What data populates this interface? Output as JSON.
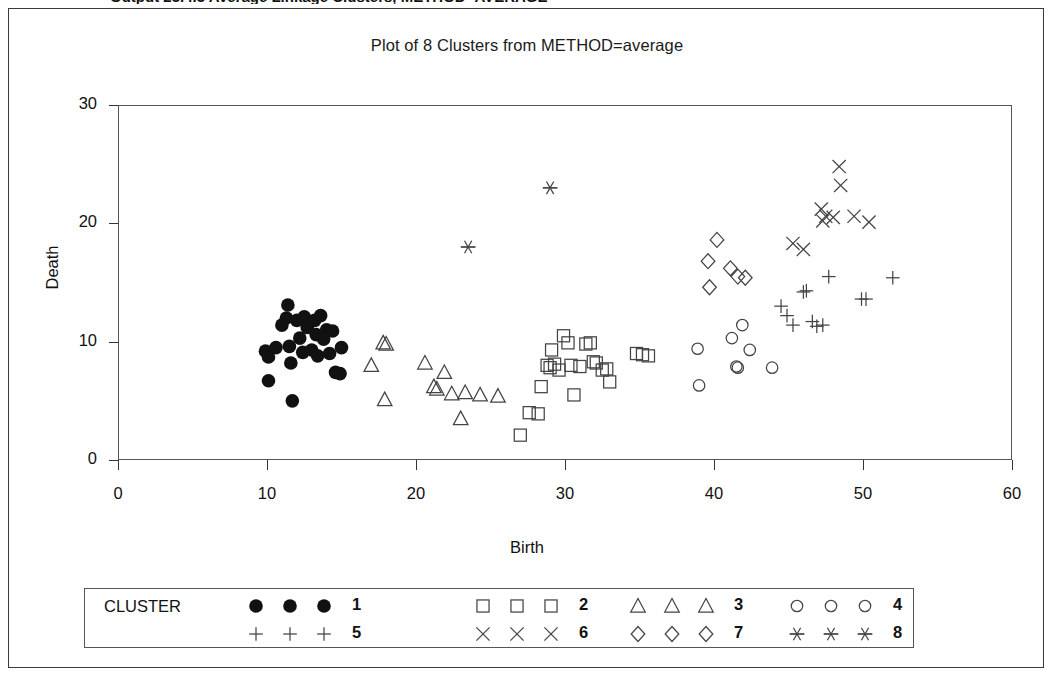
{
  "top_heading": "Output 23.4.3 Average Linkage Clusters, METHOD=AVERAGE",
  "chart_title": "Plot of 8 Clusters from METHOD=average",
  "axes": {
    "xlabel": "Birth",
    "ylabel": "Death",
    "xticks": [
      "0",
      "10",
      "20",
      "30",
      "40",
      "50",
      "60"
    ],
    "yticks": [
      "0",
      "10",
      "20",
      "30"
    ]
  },
  "legend": {
    "title": "CLUSTER",
    "entries": [
      {
        "label": "1",
        "symbol": "filled-circle"
      },
      {
        "label": "2",
        "symbol": "square"
      },
      {
        "label": "3",
        "symbol": "triangle"
      },
      {
        "label": "4",
        "symbol": "circle"
      },
      {
        "label": "5",
        "symbol": "plus"
      },
      {
        "label": "6",
        "symbol": "cross"
      },
      {
        "label": "7",
        "symbol": "diamond"
      },
      {
        "label": "8",
        "symbol": "asterisk"
      }
    ]
  },
  "chart_data": {
    "type": "scatter",
    "title": "Plot of 8 Clusters from METHOD=average",
    "xlabel": "Birth",
    "ylabel": "Death",
    "xlim": [
      0,
      60
    ],
    "ylim": [
      0,
      30
    ],
    "xticks": [
      0,
      10,
      20,
      30,
      40,
      50,
      60
    ],
    "yticks": [
      0,
      10,
      20,
      30
    ],
    "grid": false,
    "legend_position": "bottom",
    "series": [
      {
        "name": "1",
        "symbol": "filled-circle",
        "points": [
          [
            9.9,
            9.2
          ],
          [
            10.1,
            8.7
          ],
          [
            10.1,
            6.7
          ],
          [
            10.6,
            9.5
          ],
          [
            11.0,
            11.4
          ],
          [
            11.3,
            12.0
          ],
          [
            11.4,
            13.1
          ],
          [
            11.5,
            9.6
          ],
          [
            11.6,
            8.2
          ],
          [
            11.7,
            5.0
          ],
          [
            12.0,
            11.8
          ],
          [
            12.2,
            10.3
          ],
          [
            12.4,
            9.1
          ],
          [
            12.5,
            12.1
          ],
          [
            12.7,
            11.2
          ],
          [
            13.0,
            9.3
          ],
          [
            13.2,
            11.8
          ],
          [
            13.3,
            10.6
          ],
          [
            13.4,
            8.8
          ],
          [
            13.6,
            12.2
          ],
          [
            13.8,
            10.2
          ],
          [
            14.0,
            11.0
          ],
          [
            14.2,
            9.0
          ],
          [
            14.4,
            10.9
          ],
          [
            14.6,
            7.4
          ],
          [
            14.9,
            7.3
          ],
          [
            15.0,
            9.5
          ]
        ]
      },
      {
        "name": "2",
        "symbol": "square",
        "points": [
          [
            27.0,
            2.1
          ],
          [
            27.6,
            4.0
          ],
          [
            28.2,
            3.9
          ],
          [
            28.4,
            6.2
          ],
          [
            28.8,
            8.0
          ],
          [
            29.0,
            7.8
          ],
          [
            29.1,
            9.3
          ],
          [
            29.3,
            8.1
          ],
          [
            29.6,
            7.6
          ],
          [
            29.9,
            10.5
          ],
          [
            30.2,
            9.9
          ],
          [
            30.4,
            8.0
          ],
          [
            30.6,
            5.5
          ],
          [
            31.0,
            7.9
          ],
          [
            31.4,
            9.8
          ],
          [
            31.7,
            9.9
          ],
          [
            31.9,
            8.3
          ],
          [
            32.1,
            8.2
          ],
          [
            32.5,
            7.6
          ],
          [
            32.8,
            7.7
          ],
          [
            33.0,
            6.6
          ],
          [
            34.8,
            9.0
          ],
          [
            35.2,
            8.9
          ],
          [
            35.6,
            8.8
          ]
        ]
      },
      {
        "name": "3",
        "symbol": "triangle",
        "points": [
          [
            17.0,
            8.0
          ],
          [
            17.8,
            9.9
          ],
          [
            18.0,
            9.8
          ],
          [
            17.9,
            5.1
          ],
          [
            20.6,
            8.2
          ],
          [
            21.2,
            6.2
          ],
          [
            21.4,
            6.0
          ],
          [
            21.9,
            7.4
          ],
          [
            22.4,
            5.6
          ],
          [
            23.0,
            3.5
          ],
          [
            23.3,
            5.7
          ],
          [
            24.3,
            5.5
          ],
          [
            25.5,
            5.4
          ]
        ]
      },
      {
        "name": "4",
        "symbol": "circle",
        "points": [
          [
            38.9,
            9.4
          ],
          [
            39.0,
            6.3
          ],
          [
            41.2,
            10.3
          ],
          [
            41.5,
            7.9
          ],
          [
            41.6,
            7.8
          ],
          [
            41.9,
            11.4
          ],
          [
            42.4,
            9.3
          ],
          [
            43.9,
            7.8
          ]
        ]
      },
      {
        "name": "5",
        "symbol": "plus",
        "points": [
          [
            44.5,
            13.0
          ],
          [
            44.9,
            12.2
          ],
          [
            45.3,
            11.4
          ],
          [
            46.0,
            14.2
          ],
          [
            46.2,
            14.3
          ],
          [
            46.6,
            11.7
          ],
          [
            46.9,
            11.3
          ],
          [
            47.3,
            11.4
          ],
          [
            47.7,
            15.5
          ],
          [
            49.9,
            13.6
          ],
          [
            50.2,
            13.6
          ],
          [
            52.0,
            15.4
          ]
        ]
      },
      {
        "name": "6",
        "symbol": "cross",
        "points": [
          [
            45.3,
            18.3
          ],
          [
            46.0,
            17.8
          ],
          [
            47.2,
            21.2
          ],
          [
            47.3,
            20.2
          ],
          [
            47.5,
            20.6
          ],
          [
            48.0,
            20.5
          ],
          [
            48.4,
            24.8
          ],
          [
            48.5,
            23.2
          ],
          [
            49.4,
            20.6
          ],
          [
            50.4,
            20.1
          ]
        ]
      },
      {
        "name": "7",
        "symbol": "diamond",
        "points": [
          [
            39.6,
            16.8
          ],
          [
            39.7,
            14.6
          ],
          [
            40.2,
            18.6
          ],
          [
            41.1,
            16.2
          ],
          [
            41.6,
            15.5
          ],
          [
            42.1,
            15.4
          ]
        ]
      },
      {
        "name": "8",
        "symbol": "asterisk",
        "points": [
          [
            23.5,
            18.0
          ],
          [
            29.0,
            23.0
          ]
        ]
      }
    ]
  }
}
